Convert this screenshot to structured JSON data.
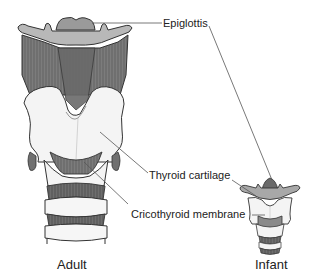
{
  "diagram": {
    "labels": {
      "epiglottis": "Epiglottis",
      "thyroid_cartilage": "Thyroid cartilage",
      "cricothyroid_membrane": "Cricothyroid membrane"
    },
    "captions": {
      "adult": "Adult",
      "infant": "Infant"
    },
    "colors": {
      "cartilage": "#f4f4f4",
      "muscle": "#7a7a7a",
      "muscle_dark": "#5a5a5a",
      "epiglottis": "#9a9a9a",
      "outline": "#333333",
      "leader_line": "#555555",
      "text": "#222222"
    }
  }
}
